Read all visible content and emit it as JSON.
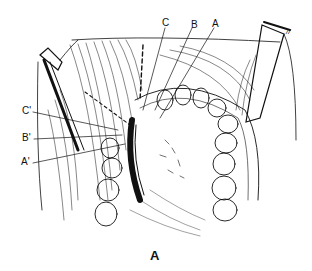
{
  "figure": {
    "caption": "A",
    "labels": {
      "top": [
        {
          "text": "C",
          "x": 162,
          "y": 18
        },
        {
          "text": "B",
          "x": 191,
          "y": 20
        },
        {
          "text": "A",
          "x": 212,
          "y": 19
        }
      ],
      "left": [
        {
          "text": "C'",
          "x": 22,
          "y": 109
        },
        {
          "text": "B'",
          "x": 22,
          "y": 136
        },
        {
          "text": "A'",
          "x": 21,
          "y": 160
        }
      ],
      "corner_mark": "//"
    },
    "colors": {
      "ink": "#111111",
      "background": "#ffffff"
    }
  }
}
